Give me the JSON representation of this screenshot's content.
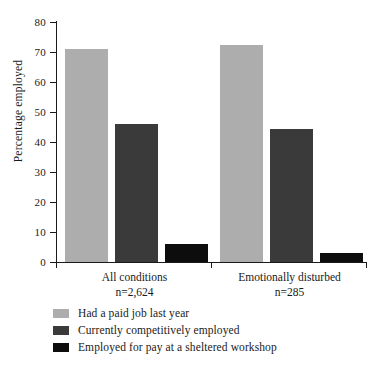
{
  "chart_data": {
    "type": "bar",
    "title": "",
    "subtitle": "",
    "xlabel": "",
    "ylabel": "Percentage employed",
    "ylim": [
      0,
      80
    ],
    "yticks": [
      0,
      10,
      20,
      30,
      40,
      50,
      60,
      70,
      80
    ],
    "grid": false,
    "legend_position": "bottom-left",
    "categories": [
      "All conditions",
      "Emotionally disturbed"
    ],
    "category_sublabels": [
      "n=2,624",
      "n=285"
    ],
    "series": [
      {
        "name": "Had a paid job last year",
        "color": "#adadad",
        "values": [
          71,
          72.5
        ]
      },
      {
        "name": "Currently competitively employed",
        "color": "#3a3a3a",
        "values": [
          46,
          44.5
        ]
      },
      {
        "name": "Employed for pay at a sheltered workshop",
        "color": "#0d0d0d",
        "values": [
          6,
          3
        ]
      }
    ]
  },
  "axis": {
    "y_title": "Percentage employed",
    "y_tick_labels": [
      "80",
      "70",
      "60",
      "50",
      "40",
      "30",
      "20",
      "10",
      "0"
    ]
  },
  "groups": [
    {
      "label": "All conditions",
      "n_label": "n=2,624"
    },
    {
      "label": "Emotionally disturbed",
      "n_label": "n=285"
    }
  ],
  "legend": {
    "items": [
      {
        "label": "Had a paid job last year",
        "color": "#adadad"
      },
      {
        "label": "Currently competitively employed",
        "color": "#3a3a3a"
      },
      {
        "label": "Employed for pay at a sheltered workshop",
        "color": "#0d0d0d"
      }
    ]
  }
}
